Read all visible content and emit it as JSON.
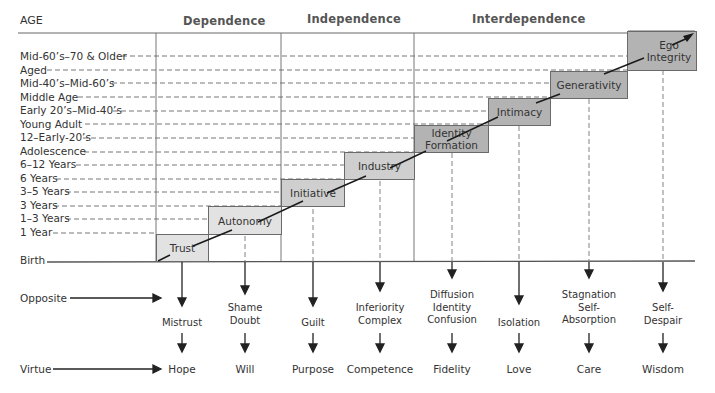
{
  "title_axis": "AGE",
  "groups": [
    {
      "label": "Dependence"
    },
    {
      "label": "Independence"
    },
    {
      "label": "Interdependence"
    }
  ],
  "age_labels": [
    "Mid-60’s–70 & Older",
    "Aged",
    "Mid-40’s–Mid-60’s",
    "Middle Age",
    "Early 20’s–Mid-40’s",
    "Young Adult",
    "12–Early-20’s",
    "Adolescence",
    "6–12 Years",
    "6 Years",
    "3–5 Years",
    "3 Years",
    "1–3 Years",
    "1 Year",
    "Birth"
  ],
  "stages": [
    {
      "name": "Trust",
      "opposite": "Mistrust",
      "virtue": "Hope",
      "shade": "#e2e2e2"
    },
    {
      "name": "Autonomy",
      "opposite": "Shame Doubt",
      "virtue": "Will",
      "shade": "#e2e2e2"
    },
    {
      "name": "Initiative",
      "opposite": "Guilt",
      "virtue": "Purpose",
      "shade": "#cfcfcf"
    },
    {
      "name": "Industry",
      "opposite": "Inferiority Complex",
      "virtue": "Competence",
      "shade": "#cfcfcf"
    },
    {
      "name": "Identity Formation",
      "opposite": "Diffusion Identity Confusion",
      "virtue": "Fidelity",
      "shade": "#b3b3b3"
    },
    {
      "name": "Intimacy",
      "opposite": "Isolation",
      "virtue": "Love",
      "shade": "#b3b3b3"
    },
    {
      "name": "Generativity",
      "opposite": "Stagnation Self-Absorption",
      "virtue": "Care",
      "shade": "#b3b3b3"
    },
    {
      "name": "Ego Integrity",
      "opposite": "Self-Despair",
      "virtue": "Wisdom",
      "shade": "#b3b3b3"
    }
  ],
  "stage_lines": {
    "trust": [
      "Trust"
    ],
    "autonomy": [
      "Autonomy"
    ],
    "initiative": [
      "Initiative"
    ],
    "industry": [
      "Industry"
    ],
    "identity": [
      "Identity",
      "Formation"
    ],
    "intimacy": [
      "Intimacy"
    ],
    "generativity": [
      "Generativity"
    ],
    "ego": [
      "Ego",
      "Integrity"
    ]
  },
  "opposites": {
    "trust": [
      "Mistrust"
    ],
    "autonomy": [
      "Shame",
      "Doubt"
    ],
    "initiative": [
      "Guilt"
    ],
    "industry": [
      "Inferiority",
      "Complex"
    ],
    "identity": [
      "Diffusion",
      "Identity",
      "Confusion"
    ],
    "intimacy": [
      "Isolation"
    ],
    "generativity": [
      "Stagnation",
      "Self-",
      "Absorption"
    ],
    "ego": [
      "Self-",
      "Despair"
    ]
  },
  "side_labels": {
    "opposite": "Opposite",
    "virtue": "Virtue"
  }
}
